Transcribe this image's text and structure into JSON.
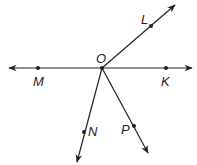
{
  "diagram": {
    "type": "geometry-rays",
    "vertex": {
      "label": "O",
      "x": 102,
      "y": 68
    },
    "line": {
      "description": "line MK through O",
      "left_arrow": [
        8,
        68
      ],
      "right_arrow": [
        193,
        68
      ]
    },
    "points": [
      {
        "label": "M",
        "x": 38,
        "y": 68
      },
      {
        "label": "K",
        "x": 166,
        "y": 68
      },
      {
        "label": "L",
        "x": 151,
        "y": 26
      },
      {
        "label": "N",
        "x": 84,
        "y": 132
      },
      {
        "label": "P",
        "x": 134,
        "y": 126
      }
    ],
    "rays": [
      {
        "name": "ray OL",
        "to": [
          175,
          5
        ]
      },
      {
        "name": "ray ON",
        "to": [
          77,
          162
        ]
      },
      {
        "name": "ray OP",
        "to": [
          148,
          153
        ]
      }
    ],
    "colors": {
      "stroke": "#222222",
      "background": "#ffffff"
    }
  }
}
